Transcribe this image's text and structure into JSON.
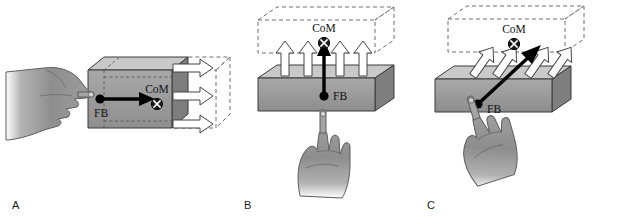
{
  "figure": {
    "caption_letters": [
      "A",
      "B",
      "C"
    ],
    "background_color": "#ffffff",
    "ink_color": "#111111",
    "box_face_front_color": "#9a9a9a",
    "box_face_top_color": "#c9c9c9",
    "box_face_side_color": "#7e7e7e",
    "hand_color": "#8e8e8e",
    "ghost_outline_color": "#6e6e6e",
    "force_arrow_color": "#000000",
    "motion_arrow_fill": "#ffffff",
    "motion_arrow_stroke": "#444444"
  },
  "panels": [
    {
      "id": "A",
      "letter": "A",
      "force_label": "FB",
      "com_label": "CoM",
      "com_symbol": "circle-x",
      "force_direction": "horizontal-right",
      "force_angle_deg": 0,
      "motion_arrow_count": 3,
      "motion_direction": "right",
      "hand_position": "left",
      "hand_finger_direction": "right",
      "ghost_box_position": "right",
      "description": "Finger pushes the box horizontally at its left face; box translates to the right."
    },
    {
      "id": "B",
      "letter": "B",
      "force_label": "FB",
      "com_label": "CoM",
      "com_symbol": "circle-x",
      "force_direction": "vertical-up",
      "force_angle_deg": 90,
      "motion_arrow_count": 4,
      "motion_direction": "up",
      "hand_position": "below",
      "hand_finger_direction": "up",
      "ghost_box_position": "above",
      "description": "Finger pushes the slab straight up from underneath; slab translates upward."
    },
    {
      "id": "C",
      "letter": "C",
      "force_label": "FB",
      "com_label": "CoM",
      "com_symbol": "circle-x",
      "force_direction": "diagonal-up-right",
      "force_angle_deg": 45,
      "motion_arrow_count": 4,
      "motion_direction": "up-right",
      "hand_position": "below-left",
      "hand_finger_direction": "up-right",
      "ghost_box_position": "above-right",
      "description": "Finger pushes the slab diagonally up and to the right; slab translates up-right."
    }
  ]
}
